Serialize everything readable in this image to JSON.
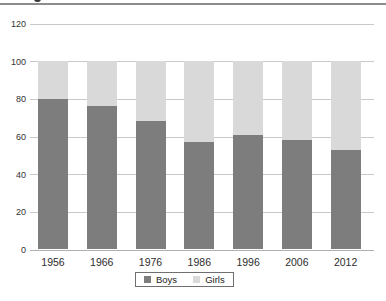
{
  "page": {
    "cropped_title_fragment": ""
  },
  "chart_data": {
    "type": "bar",
    "stacked": true,
    "stacked_total": 100,
    "title": "",
    "xlabel": "",
    "ylabel": "",
    "categories": [
      "1956",
      "1966",
      "1976",
      "1986",
      "1996",
      "2006",
      "2012"
    ],
    "series": [
      {
        "name": "Boys",
        "color": "#7d7d7d",
        "values": [
          80,
          76,
          68,
          57,
          61,
          58,
          53
        ]
      },
      {
        "name": "Girls",
        "color": "#d9d9d9",
        "values": [
          20,
          24,
          32,
          43,
          39,
          42,
          47
        ]
      }
    ],
    "ylim": [
      0,
      120
    ],
    "y_ticks": [
      0,
      20,
      40,
      60,
      80,
      100,
      120
    ],
    "grid": "horizontal",
    "gridline_color": "#c9c9c9",
    "axis_line_color": "#b0b0b0",
    "legend_position": "bottom",
    "legend_labels": [
      "Boys",
      "Girls"
    ]
  }
}
